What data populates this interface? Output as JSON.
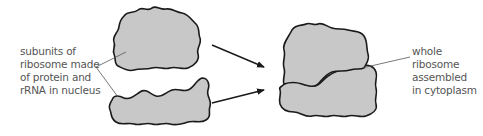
{
  "diagram": {
    "left_label": {
      "lines": [
        "subunits of",
        "ribosome made",
        "of protein and",
        "rRNA in nucleus"
      ]
    },
    "right_label": {
      "lines": [
        "whole",
        "ribosome",
        "assembled",
        "in cytoplasm"
      ]
    },
    "nodes": [
      {
        "id": "large-subunit",
        "kind": "blob"
      },
      {
        "id": "small-subunit",
        "kind": "blob"
      },
      {
        "id": "whole-ribosome",
        "kind": "blob-pair"
      }
    ],
    "edges": [
      {
        "from": "large-subunit",
        "to": "whole-ribosome",
        "kind": "arrow"
      },
      {
        "from": "small-subunit",
        "to": "whole-ribosome",
        "kind": "arrow"
      }
    ],
    "colors": {
      "fill": "#c8c8c8",
      "stroke": "#1a1a1a",
      "leader": "#555555",
      "text": "#555555"
    }
  }
}
